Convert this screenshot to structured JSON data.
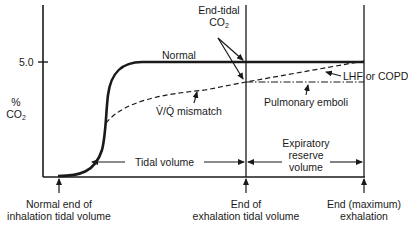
{
  "diagram": {
    "type": "capnogram",
    "y_axis": {
      "label_line1": "%",
      "label_line2": "CO",
      "label_sub": "2",
      "tick_label": "5.0"
    },
    "curves": {
      "normal": "Normal",
      "vq_mismatch": "V/Q mismatch",
      "vq_mismatch_display": "V̇/Q̇ mismatch",
      "lhf_copd": "LHF or COPD",
      "pulmonary_emboli": "Pulmonary emboli"
    },
    "annotations": {
      "end_tidal_line1": "End-tidal",
      "end_tidal_line2": "CO",
      "end_tidal_sub": "2",
      "tidal_volume": "Tidal volume",
      "expiratory_reserve_line1": "Expiratory",
      "expiratory_reserve_line2": "reserve",
      "expiratory_reserve_line3": "volume"
    },
    "x_markers": {
      "start_line1": "Normal end of",
      "start_line2": "inhalation tidal volume",
      "mid_line1": "End of",
      "mid_line2": "exhalation tidal volume",
      "end_line1": "End (maximum)",
      "end_line2": "exhalation"
    },
    "colors": {
      "ink": "#1a1a1a",
      "background": "#ffffff"
    }
  }
}
